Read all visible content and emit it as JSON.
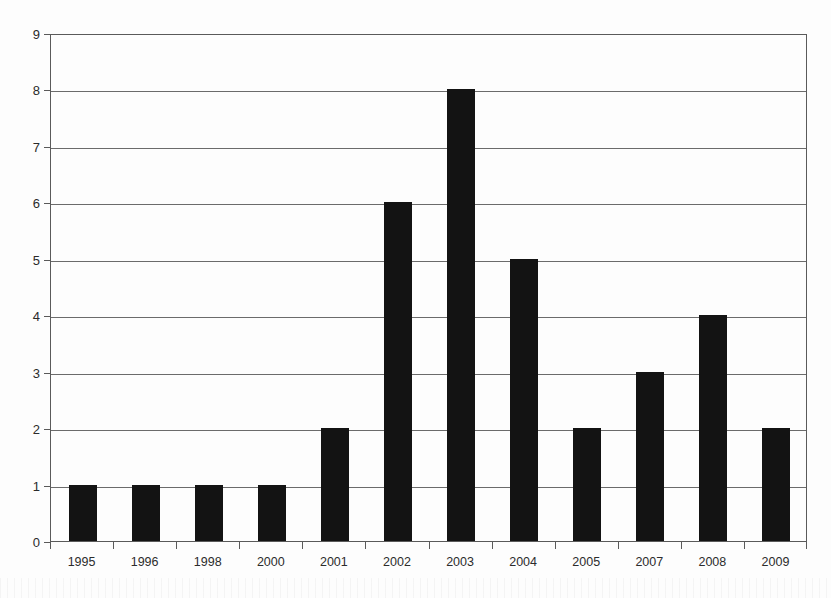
{
  "chart_data": {
    "type": "bar",
    "title": "",
    "subtitle": "",
    "xlabel": "",
    "ylabel": "",
    "categories": [
      "1995",
      "1996",
      "1998",
      "2000",
      "2001",
      "2002",
      "2003",
      "2004",
      "2005",
      "2007",
      "2008",
      "2009"
    ],
    "values": [
      1,
      1,
      1,
      1,
      2,
      6,
      8,
      5,
      2,
      3,
      4,
      2
    ],
    "series": [
      {
        "name": "",
        "values": [
          1,
          1,
          1,
          1,
          2,
          6,
          8,
          5,
          2,
          3,
          4,
          2
        ]
      }
    ],
    "ylim": [
      0,
      9
    ],
    "ytick_labels": [
      "0",
      "1",
      "2",
      "3",
      "4",
      "5",
      "6",
      "7",
      "8",
      "9"
    ],
    "ytick_values": [
      0,
      1,
      2,
      3,
      4,
      5,
      6,
      7,
      8,
      9
    ],
    "ytick_step": 1,
    "xlim_categories": 12,
    "grid": {
      "horizontal": true,
      "vertical": false
    },
    "legend": {
      "visible": false,
      "position": "none",
      "entries": []
    },
    "annotations": [],
    "data_labels_visible": false,
    "colors": {
      "bar_fill": "#131313",
      "gridline": "#6b6b6b",
      "axis_line": "#5a5a5a",
      "background": "#fdfdfd",
      "tick_text": "#2c2c2c"
    }
  }
}
